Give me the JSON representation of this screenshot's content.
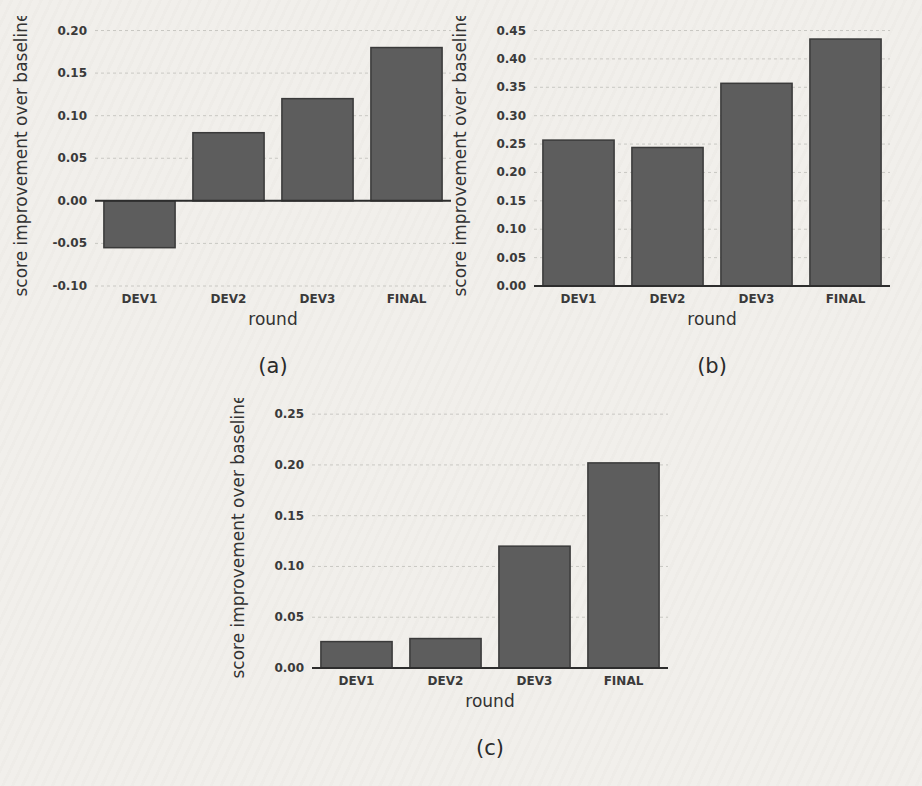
{
  "colors": {
    "background": "#f1efeb",
    "bar_fill": "#5d5d5d",
    "bar_edge": "#3a3a3a",
    "gridline": "#c9c8c3",
    "axis_line": "#2d2d2d",
    "text": "#3a3a3a",
    "label_text": "#333333"
  },
  "chart_data": [
    {
      "type": "bar",
      "panel_label": "(a)",
      "categories": [
        "DEV1",
        "DEV2",
        "DEV3",
        "FINAL"
      ],
      "values": [
        -0.055,
        0.08,
        0.12,
        0.18
      ],
      "xlabel": "round",
      "ylabel": "score improvement over baseline",
      "ylim": [
        -0.1,
        0.21
      ],
      "yticks": [
        -0.1,
        -0.05,
        0.0,
        0.05,
        0.1,
        0.15,
        0.2
      ],
      "grid": true,
      "legend": null
    },
    {
      "type": "bar",
      "panel_label": "(b)",
      "categories": [
        "DEV1",
        "DEV2",
        "DEV3",
        "FINAL"
      ],
      "values": [
        0.257,
        0.244,
        0.357,
        0.435
      ],
      "xlabel": "round",
      "ylabel": "score improvement over baseline",
      "ylim": [
        0.0,
        0.465
      ],
      "yticks": [
        0.0,
        0.05,
        0.1,
        0.15,
        0.2,
        0.25,
        0.3,
        0.35,
        0.4,
        0.45
      ],
      "grid": true,
      "legend": null
    },
    {
      "type": "bar",
      "panel_label": "(c)",
      "categories": [
        "DEV1",
        "DEV2",
        "DEV3",
        "FINAL"
      ],
      "values": [
        0.026,
        0.029,
        0.12,
        0.202
      ],
      "xlabel": "round",
      "ylabel": "score improvement over baseline",
      "ylim": [
        0.0,
        0.26
      ],
      "yticks": [
        0.0,
        0.05,
        0.1,
        0.15,
        0.2,
        0.25
      ],
      "grid": true,
      "legend": null
    }
  ]
}
